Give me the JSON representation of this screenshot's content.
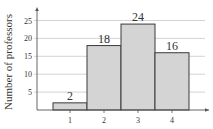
{
  "chart_data": {
    "type": "bar",
    "title": "",
    "xlabel": "",
    "ylabel": "Number of professors",
    "categories": [
      "1",
      "2",
      "3",
      "4"
    ],
    "values": [
      2,
      18,
      24,
      16
    ],
    "data_labels": [
      "2",
      "18",
      "24",
      "16"
    ],
    "yticks": [
      5,
      10,
      15,
      20,
      25
    ],
    "ytick_labels": [
      "5",
      "10",
      "15",
      "20",
      "25"
    ],
    "ylim": [
      0,
      27
    ],
    "grid": true,
    "legend": null,
    "histogram_style": true
  },
  "colors": {
    "bar_fill": "#d4d4d4",
    "bar_stroke": "#3a3a3a",
    "grid": "#c8c8c8",
    "axis": "#555555",
    "text": "#333333"
  }
}
